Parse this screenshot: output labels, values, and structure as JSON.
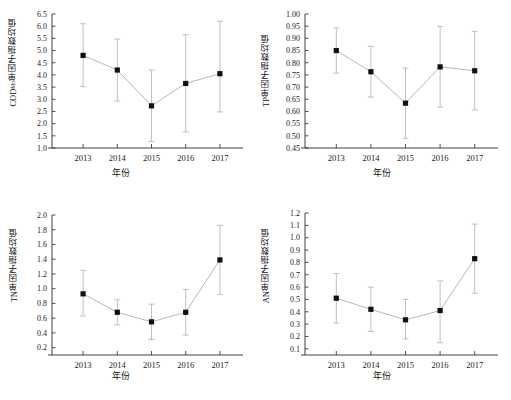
{
  "figure": {
    "background": "#ffffff",
    "marker_color": "#101010",
    "line_color": "#b8b8b8",
    "errorbar_color": "#b0b0b0",
    "axis_color": "#2a2a2a"
  },
  "chart_data": [
    {
      "type": "line",
      "panel": "top-left",
      "title": "",
      "xlabel": "年份",
      "ylabel": "CODMn单因子指数均值",
      "ylabel_base": "COD",
      "ylabel_sub": "Mn",
      "ylabel_rest": "单因子指数均值",
      "categories": [
        "2013",
        "2014",
        "2015",
        "2016",
        "2017"
      ],
      "x": [
        2013,
        2014,
        2015,
        2016,
        2017
      ],
      "values": [
        4.8,
        4.2,
        2.73,
        3.65,
        4.05
      ],
      "err_low": [
        3.52,
        2.93,
        1.27,
        1.66,
        2.48
      ],
      "err_high": [
        6.1,
        5.47,
        4.2,
        5.65,
        6.2
      ],
      "ylim": [
        1.0,
        6.5
      ],
      "yticks": [
        "6.5",
        "6.0",
        "5.5",
        "5.0",
        "4.5",
        "4.0",
        "3.5",
        "3.0",
        "2.5",
        "2.0",
        "1.5",
        "1.0"
      ],
      "ytick_values": [
        6.5,
        6.0,
        5.5,
        5.0,
        4.5,
        4.0,
        3.5,
        3.0,
        2.5,
        2.0,
        1.5,
        1.0
      ],
      "grid": false,
      "legend": "none"
    },
    {
      "type": "line",
      "panel": "top-right",
      "title": "",
      "xlabel": "年份",
      "ylabel": "TP单因子指数均值",
      "ylabel_base": "TP",
      "ylabel_sub": "",
      "ylabel_rest": "单因子指数均值",
      "categories": [
        "2013",
        "2014",
        "2015",
        "2016",
        "2017"
      ],
      "x": [
        2013,
        2014,
        2015,
        2016,
        2017
      ],
      "values": [
        0.85,
        0.763,
        0.634,
        0.783,
        0.767
      ],
      "err_low": [
        0.757,
        0.659,
        0.49,
        0.618,
        0.606
      ],
      "err_high": [
        0.943,
        0.867,
        0.778,
        0.949,
        0.928
      ],
      "ylim": [
        0.45,
        1.0
      ],
      "yticks": [
        "1.00",
        "0.95",
        "0.90",
        "0.85",
        "0.80",
        "0.75",
        "0.70",
        "0.65",
        "0.60",
        "0.55",
        "0.50",
        "0.45"
      ],
      "ytick_values": [
        1.0,
        0.95,
        0.9,
        0.85,
        0.8,
        0.75,
        0.7,
        0.65,
        0.6,
        0.55,
        0.5,
        0.45
      ],
      "grid": false,
      "legend": "none"
    },
    {
      "type": "line",
      "panel": "bottom-left",
      "title": "",
      "xlabel": "年份",
      "ylabel": "TN单因子指数均值",
      "ylabel_base": "TN",
      "ylabel_sub": "",
      "ylabel_rest": "单因子指数均值",
      "categories": [
        "2013",
        "2014",
        "2015",
        "2016",
        "2017"
      ],
      "x": [
        2013,
        2014,
        2015,
        2016,
        2017
      ],
      "values": [
        0.93,
        0.68,
        0.55,
        0.68,
        1.39
      ],
      "err_low": [
        0.63,
        0.51,
        0.31,
        0.37,
        0.92
      ],
      "err_high": [
        1.25,
        0.85,
        0.79,
        0.99,
        1.86
      ],
      "ylim": [
        0.1,
        2.0
      ],
      "yticks": [
        "2.0",
        "1.8",
        "1.6",
        "1.4",
        "1.2",
        "1.0",
        "0.8",
        "0.6",
        "0.4",
        "0.2"
      ],
      "ytick_values": [
        2.0,
        1.8,
        1.6,
        1.4,
        1.2,
        1.0,
        0.8,
        0.6,
        0.4,
        0.2
      ],
      "grid": false,
      "legend": "none"
    },
    {
      "type": "line",
      "panel": "bottom-right",
      "title": "",
      "xlabel": "年份",
      "ylabel": "AN单因子指数均值",
      "ylabel_base": "AN",
      "ylabel_sub": "",
      "ylabel_rest": "单因子指数均值",
      "categories": [
        "2013",
        "2014",
        "2015",
        "2016",
        "2017"
      ],
      "x": [
        2013,
        2014,
        2015,
        2016,
        2017
      ],
      "values": [
        0.51,
        0.42,
        0.335,
        0.41,
        0.83
      ],
      "err_low": [
        0.31,
        0.24,
        0.18,
        0.15,
        0.55
      ],
      "err_high": [
        0.71,
        0.6,
        0.5,
        0.65,
        1.11
      ],
      "ylim": [
        0.05,
        1.2
      ],
      "yticks": [
        "1.2",
        "1.1",
        "1.0",
        "0.9",
        "0.8",
        "0.7",
        "0.6",
        "0.5",
        "0.4",
        "0.3",
        "0.2",
        "0.1"
      ],
      "ytick_values": [
        1.2,
        1.1,
        1.0,
        0.9,
        0.8,
        0.7,
        0.6,
        0.5,
        0.4,
        0.3,
        0.2,
        0.1
      ],
      "grid": false,
      "legend": "none"
    }
  ]
}
